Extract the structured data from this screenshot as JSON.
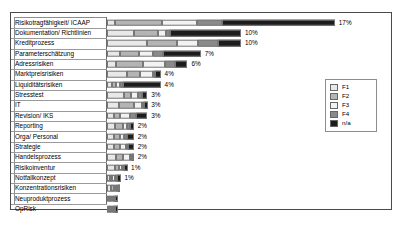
{
  "chart_data": {
    "type": "bar",
    "orientation": "horizontal",
    "stacked": true,
    "title": "",
    "subtitle": "",
    "xlabel": "",
    "ylabel": "",
    "grid": false,
    "xlim": [
      0,
      20
    ],
    "legend_position": "right",
    "legend": [
      "F1",
      "F2",
      "F3",
      "F4",
      "n/a"
    ],
    "series_colors": [
      "#e8e8e8",
      "#b4b4b4",
      "#f2f2f2",
      "#8a8a8a",
      "#1c1c1c"
    ],
    "categories": [
      "Risikotragfähigkeit/ ICAAP",
      "Dokumentation/ Richtlinien",
      "Kreditprozess",
      "Parameterschätzung",
      "Adressrisiken",
      "Marktpreisrisiken",
      "Liquiditätsrisiken",
      "Stresstest",
      "IT",
      "Revision/ IKS",
      "Reporting",
      "Orga/ Personal",
      "Strategie",
      "Handelsprozess",
      "Risikoinventur",
      "Notfallkonzept",
      "Konzentrationsrisiken",
      "Neuproduktprozess",
      "OpRisk"
    ],
    "totals": [
      "17%",
      "10%",
      "10%",
      "7%",
      "6%",
      "4%",
      "4%",
      "3%",
      "3%",
      "3%",
      "2%",
      "2%",
      "2%",
      "2%",
      "1%",
      "1%",
      "",
      "",
      ""
    ],
    "total_values": [
      17,
      10,
      10,
      7,
      6,
      4,
      4,
      3,
      3,
      3,
      2,
      2,
      2,
      2,
      1,
      1,
      0.7,
      0.4,
      0.35
    ],
    "series": [
      {
        "name": "F1",
        "values": [
          0.6,
          2.0,
          3.0,
          1.0,
          0.7,
          1.5,
          0.4,
          1.3,
          0.9,
          0.5,
          0.6,
          0.5,
          0.5,
          0.7,
          0.6,
          0.2,
          0.3,
          0.05,
          0.05
        ]
      },
      {
        "name": "F2",
        "values": [
          3.5,
          1.8,
          2.2,
          1.4,
          2.0,
          1.0,
          0.3,
          0.5,
          1.1,
          0.5,
          0.6,
          0.5,
          0.5,
          0.5,
          0.3,
          0.2,
          0.2,
          0.05,
          0.05
        ]
      },
      {
        "name": "F3",
        "values": [
          2.6,
          0.6,
          1.6,
          1.0,
          1.6,
          0.9,
          0.3,
          0.5,
          0.6,
          0.7,
          0.3,
          0.3,
          0.4,
          0.5,
          0.2,
          0.2,
          0.2,
          0.05,
          0.05
        ]
      },
      {
        "name": "F4",
        "values": [
          1.9,
          0.3,
          1.5,
          0.8,
          0.8,
          0.2,
          0.2,
          0.3,
          0.1,
          0.5,
          0.2,
          0.2,
          0.2,
          0.2,
          0.1,
          0.1,
          0.05,
          0.05,
          0.05
        ]
      },
      {
        "name": "n/a",
        "values": [
          8.4,
          5.3,
          1.7,
          2.8,
          0.9,
          0.4,
          2.8,
          0.4,
          0.3,
          0.8,
          0.3,
          0.5,
          0.4,
          0.1,
          0.3,
          0.3,
          0.05,
          0.25,
          0.2
        ]
      }
    ]
  }
}
